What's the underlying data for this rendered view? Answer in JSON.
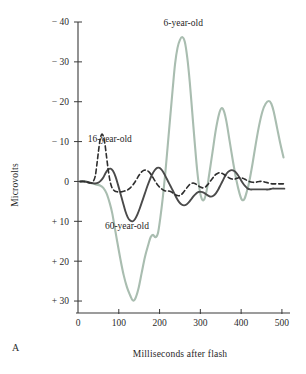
{
  "panel": {
    "letter": "A"
  },
  "chart_data": {
    "type": "line",
    "title": "",
    "xlabel": "Milliseconds after flash",
    "ylabel": "Microvolts",
    "xlim": [
      0,
      510
    ],
    "ylim": [
      -40,
      33
    ],
    "y_inverted": true,
    "grid": false,
    "legend_position": "inline-annotations",
    "xticks": [
      0,
      100,
      200,
      300,
      400,
      500
    ],
    "xticklabels": [
      "0",
      "100",
      "200",
      "300",
      "400",
      "500"
    ],
    "yticks": [
      -40,
      -30,
      -20,
      -10,
      0,
      10,
      20,
      30
    ],
    "yticklabels": [
      "− 40",
      "− 30",
      "− 20",
      "− 10",
      "0",
      "+ 10",
      "+ 20",
      "+ 30"
    ],
    "annotations": [
      {
        "text": "6-year-old",
        "x": 258,
        "y": -39
      },
      {
        "text": "16-year-old",
        "x": 78,
        "y": -10
      },
      {
        "text": "60-year-old",
        "x": 120,
        "y": 12
      }
    ],
    "series": [
      {
        "name": "6-year-old",
        "color": "#a9bdb0",
        "style": "solid",
        "x": [
          5,
          18,
          28,
          38,
          46,
          54,
          62,
          70,
          78,
          84,
          90,
          96,
          104,
          112,
          120,
          128,
          134,
          140,
          148,
          156,
          164,
          172,
          178,
          184,
          190,
          196,
          202,
          208,
          214,
          220,
          226,
          232,
          238,
          244,
          250,
          256,
          262,
          268,
          274,
          280,
          286,
          292,
          298,
          304,
          310,
          316,
          322,
          330,
          338,
          346,
          352,
          358,
          364,
          372,
          380,
          388,
          396,
          402,
          408,
          414,
          420,
          428,
          436,
          444,
          452,
          460,
          468,
          474,
          480,
          488,
          496,
          504
        ],
        "y": [
          0,
          0,
          0.3,
          0.6,
          0.8,
          1.0,
          1.6,
          3.0,
          5.5,
          8.0,
          11.5,
          15.0,
          19.5,
          23.5,
          26.5,
          28.6,
          29.8,
          29.5,
          27.0,
          23.0,
          19.0,
          16.0,
          14.0,
          13.4,
          14.0,
          13.0,
          9.0,
          4.0,
          -2.0,
          -9.0,
          -16.0,
          -23.0,
          -29.5,
          -33.5,
          -35.5,
          -36.2,
          -35.0,
          -31.0,
          -25.0,
          -17.5,
          -10.0,
          -3.0,
          2.0,
          4.5,
          4.4,
          2.0,
          -2.0,
          -7.5,
          -13.0,
          -17.0,
          -18.4,
          -17.6,
          -15.0,
          -10.0,
          -5.0,
          -0.5,
          3.0,
          4.6,
          4.4,
          2.5,
          0.0,
          -4.5,
          -9.5,
          -14.0,
          -17.5,
          -19.5,
          -20.2,
          -19.5,
          -17.5,
          -13.5,
          -9.5,
          -6.0
        ]
      },
      {
        "name": "60-year-old",
        "color": "#4a4a4a",
        "style": "solid",
        "x": [
          5,
          16,
          26,
          34,
          42,
          50,
          56,
          62,
          68,
          74,
          80,
          86,
          92,
          98,
          104,
          110,
          116,
          122,
          128,
          134,
          140,
          146,
          152,
          158,
          164,
          170,
          176,
          182,
          188,
          194,
          200,
          206,
          212,
          218,
          224,
          230,
          236,
          242,
          248,
          254,
          260,
          266,
          272,
          278,
          284,
          290,
          296,
          302,
          308,
          314,
          320,
          326,
          332,
          338,
          344,
          350,
          356,
          362,
          368,
          374,
          380,
          386,
          392,
          398,
          404,
          410,
          416,
          422,
          428,
          436,
          444,
          452,
          460,
          468,
          476,
          484,
          492,
          500,
          506
        ],
        "y": [
          0,
          0,
          0.2,
          0.4,
          0.5,
          0.3,
          -0.2,
          -1.0,
          -2.2,
          -3.0,
          -3.2,
          -2.6,
          -1.2,
          0.8,
          3.0,
          5.2,
          7.4,
          9.0,
          9.8,
          10.0,
          9.4,
          8.2,
          6.6,
          4.8,
          3.0,
          1.2,
          -0.4,
          -1.8,
          -2.8,
          -3.4,
          -3.4,
          -2.8,
          -1.8,
          -0.6,
          0.6,
          1.8,
          3.0,
          4.2,
          5.2,
          5.8,
          6.0,
          5.8,
          5.2,
          4.4,
          3.6,
          3.0,
          2.6,
          2.6,
          2.8,
          3.2,
          3.6,
          3.8,
          3.6,
          3.0,
          2.0,
          0.8,
          -0.4,
          -1.6,
          -2.4,
          -2.8,
          -2.8,
          -2.4,
          -1.6,
          -0.6,
          0.4,
          1.2,
          1.8,
          2.0,
          2.0,
          2.0,
          2.0,
          2.0,
          2.0,
          2.0,
          1.8,
          1.8,
          1.8,
          1.8,
          1.8
        ]
      },
      {
        "name": "16-year-old",
        "color": "#2e2e2e",
        "style": "dashed",
        "x": [
          5,
          14,
          22,
          30,
          36,
          42,
          46,
          50,
          54,
          58,
          62,
          66,
          70,
          74,
          78,
          82,
          86,
          90,
          96,
          102,
          108,
          114,
          120,
          126,
          132,
          138,
          144,
          150,
          156,
          162,
          168,
          174,
          180,
          186,
          192,
          198,
          204,
          210,
          216,
          222,
          228,
          234,
          240,
          246,
          252,
          258,
          264,
          270,
          276,
          282,
          288,
          294,
          300,
          306,
          312,
          318,
          324,
          330,
          336,
          342,
          348,
          354,
          360,
          366,
          372,
          378,
          384,
          390,
          396,
          404,
          412,
          420,
          428,
          436,
          444,
          452,
          460,
          468,
          476,
          484,
          492,
          500,
          506
        ],
        "y": [
          0,
          0,
          0.2,
          0.4,
          0.2,
          -1.2,
          -4.0,
          -7.4,
          -10.4,
          -11.8,
          -11.4,
          -9.4,
          -6.2,
          -3.0,
          -0.4,
          1.2,
          2.0,
          2.4,
          2.6,
          2.6,
          2.6,
          2.4,
          2.2,
          1.8,
          1.2,
          0.4,
          -0.6,
          -1.6,
          -2.4,
          -2.8,
          -2.8,
          -2.4,
          -1.6,
          -0.6,
          0.4,
          1.2,
          1.8,
          2.2,
          2.4,
          2.4,
          2.6,
          3.0,
          3.4,
          3.6,
          3.4,
          2.8,
          2.0,
          1.2,
          0.6,
          0.4,
          0.6,
          1.0,
          1.4,
          1.6,
          1.4,
          0.8,
          0.0,
          -0.8,
          -1.6,
          -2.0,
          -2.2,
          -2.0,
          -1.6,
          -1.2,
          -0.8,
          -0.6,
          -0.6,
          -0.8,
          -1.0,
          -0.8,
          -0.4,
          0.0,
          0.2,
          0.2,
          0.0,
          0.0,
          0.2,
          0.4,
          0.6,
          0.6,
          0.6,
          0.6,
          0.6
        ]
      }
    ]
  }
}
